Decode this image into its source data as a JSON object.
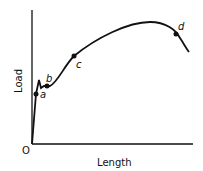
{
  "diagram": {
    "type": "load-elongation curve",
    "axes": {
      "x_label": "Length",
      "y_label": "Load",
      "origin_label": "O"
    },
    "points": [
      {
        "label": "a",
        "x": 36,
        "y": 94
      },
      {
        "label": "b",
        "x": 47,
        "y": 86
      },
      {
        "label": "c",
        "x": 74,
        "y": 56
      },
      {
        "label": "d",
        "x": 176,
        "y": 34
      }
    ],
    "colors": {
      "line": "#111111",
      "background": "#ffffff"
    }
  }
}
